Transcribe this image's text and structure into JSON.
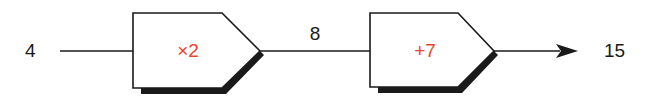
{
  "diagram": {
    "type": "function-machine-chain",
    "input": "4",
    "intermediate": "8",
    "output": "15",
    "machines": [
      {
        "operation": "×2"
      },
      {
        "operation": "+7"
      }
    ],
    "colors": {
      "operation_text": "#e8452c",
      "stroke": "#1a1a1a",
      "shadow": "#1a1a1a",
      "box_fill": "#ffffff"
    }
  }
}
